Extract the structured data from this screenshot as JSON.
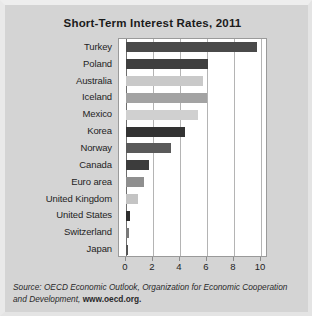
{
  "chart_data": {
    "type": "bar",
    "orientation": "horizontal",
    "title": "Short-Term Interest Rates, 2011",
    "xlabel": "",
    "ylabel": "",
    "xlim": [
      0,
      10
    ],
    "xticks": [
      0,
      2,
      4,
      6,
      8,
      10
    ],
    "xtick_labels": [
      "0",
      "2",
      "4",
      "6",
      "8",
      "10"
    ],
    "grid": true,
    "legend": false,
    "categories": [
      "Turkey",
      "Poland",
      "Australia",
      "Iceland",
      "Mexico",
      "Korea",
      "Norway",
      "Canada",
      "Euro area",
      "United Kingdom",
      "United States",
      "Switzerland",
      "Japan"
    ],
    "values": [
      9.7,
      6.1,
      5.7,
      6.0,
      5.3,
      4.4,
      3.3,
      1.7,
      1.3,
      0.9,
      0.3,
      0.2,
      0.15
    ],
    "bar_colors": [
      "#4a4a4a",
      "#3f3f3f",
      "#c9c9c9",
      "#a3a3a3",
      "#d0d0d0",
      "#333333",
      "#5a5a5a",
      "#3c3c3c",
      "#8f8f8f",
      "#c4c4c4",
      "#2e2e2e",
      "#7a7a7a",
      "#555555"
    ]
  },
  "source": {
    "prefix": "Source:",
    "publication": "OECD Economic Outlook",
    "organization": ", Organization for Economic Cooperation and Development,",
    "url": "www.oecd.org."
  },
  "colors": {
    "page_background": "#d4d4d4",
    "plot_background": "#ffffff",
    "gridline": "#b4b4b4",
    "axis": "#6e6e6e",
    "text": "#1e1e1e"
  }
}
